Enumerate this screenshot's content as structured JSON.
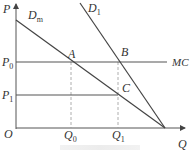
{
  "diagram": {
    "type": "economics-demand-mc",
    "axes": {
      "y_label": "P",
      "x_label": "Q",
      "origin_label": "O"
    },
    "curves": [
      {
        "id": "Dm",
        "label": "D",
        "sub": "m"
      },
      {
        "id": "D1",
        "label": "D",
        "sub": "1"
      },
      {
        "id": "MC",
        "label": "MC"
      }
    ],
    "price_levels": [
      {
        "label": "P",
        "sub": "0"
      },
      {
        "label": "P",
        "sub": "1"
      }
    ],
    "quantity_levels": [
      {
        "label": "Q",
        "sub": "0"
      },
      {
        "label": "Q",
        "sub": "1"
      }
    ],
    "points": [
      {
        "label": "A"
      },
      {
        "label": "B"
      },
      {
        "label": "C"
      }
    ],
    "colors": {
      "line": "#444444",
      "dashed": "#999999",
      "text": "#333333"
    }
  }
}
